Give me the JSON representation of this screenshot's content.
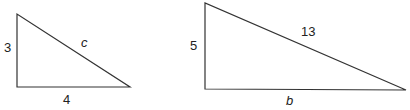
{
  "diagram": {
    "triangles": [
      {
        "name": "small-triangle",
        "legs": {
          "vertical": "3",
          "horizontal": "4"
        },
        "hypotenuse": "c"
      },
      {
        "name": "large-triangle",
        "legs": {
          "vertical": "5",
          "horizontal": "b"
        },
        "hypotenuse": "13"
      }
    ],
    "stroke_color": "#333333"
  }
}
